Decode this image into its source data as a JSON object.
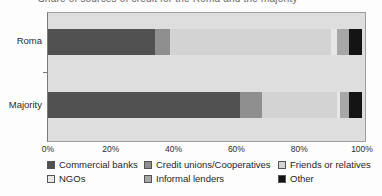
{
  "title": "Share of sources of credit for the Roma and the majority",
  "chart_data": {
    "type": "bar",
    "orientation": "horizontal",
    "stacked": true,
    "title": "Share of sources of credit for the Roma and the majority",
    "categories": [
      "Roma",
      "Majority"
    ],
    "series": [
      {
        "name": "Commercial banks",
        "color": "#515151",
        "values": [
          34,
          61
        ]
      },
      {
        "name": "Credit unions/Cooperatives",
        "color": "#8f8f8f",
        "values": [
          5,
          7
        ]
      },
      {
        "name": "Friends or relatives",
        "color": "#d3d3d3",
        "values": [
          51,
          24
        ]
      },
      {
        "name": "NGOs",
        "color": "#e7e7e7",
        "values": [
          2,
          1
        ]
      },
      {
        "name": "Informal lenders",
        "color": "#a7a7a7",
        "values": [
          4,
          3
        ]
      },
      {
        "name": "Other",
        "color": "#141414",
        "values": [
          4,
          4
        ]
      }
    ],
    "xlabel": "",
    "ylabel": "",
    "xlim": [
      0,
      100
    ],
    "x_ticks": [
      "0%",
      "20%",
      "40%",
      "60%",
      "80%",
      "100%"
    ],
    "grid": false,
    "legend_position": "bottom",
    "plot_background": "#dedede"
  }
}
